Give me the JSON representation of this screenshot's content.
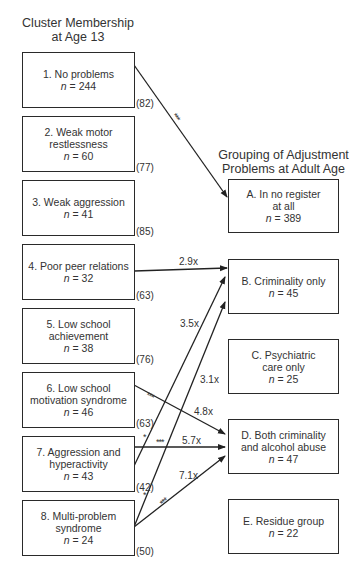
{
  "left_title": [
    "Cluster Membership",
    "at Age 13"
  ],
  "right_title": [
    "Grouping of Adjustment",
    "Problems at Adult Age"
  ],
  "clusters": [
    {
      "id": "1",
      "lines": [
        "1. No problems"
      ],
      "n": "244",
      "pct": "(82)"
    },
    {
      "id": "2",
      "lines": [
        "2. Weak motor",
        "restlessness"
      ],
      "n": "60",
      "pct": "(77)"
    },
    {
      "id": "3",
      "lines": [
        "3. Weak aggression"
      ],
      "n": "41",
      "pct": "(85)"
    },
    {
      "id": "4",
      "lines": [
        "4. Poor peer relations"
      ],
      "n": "32",
      "pct": "(63)"
    },
    {
      "id": "5",
      "lines": [
        "5. Low school",
        "achievement"
      ],
      "n": "38",
      "pct": "(76)"
    },
    {
      "id": "6",
      "lines": [
        "6. Low school",
        "motivation syndrome"
      ],
      "n": "46",
      "pct": "(63)"
    },
    {
      "id": "7",
      "lines": [
        "7. Aggression and",
        "hyperactivity"
      ],
      "n": "43",
      "pct": "(42)"
    },
    {
      "id": "8",
      "lines": [
        "8. Multi-problem",
        "syndrome"
      ],
      "n": "24",
      "pct": "(50)"
    }
  ],
  "outcomes": [
    {
      "id": "A",
      "lines": [
        "A. In no register",
        "at all"
      ],
      "n": "389"
    },
    {
      "id": "B",
      "lines": [
        "B. Criminality only"
      ],
      "n": "45"
    },
    {
      "id": "C",
      "lines": [
        "C. Psychiatric",
        "care only"
      ],
      "n": "25"
    },
    {
      "id": "D",
      "lines": [
        "D. Both criminality",
        "and alcohol abuse"
      ],
      "n": "47"
    },
    {
      "id": "E",
      "lines": [
        "E. Residue group"
      ],
      "n": "22"
    }
  ],
  "links": [
    {
      "from": "1",
      "to": "A",
      "label": "",
      "sig": "***"
    },
    {
      "from": "4",
      "to": "B",
      "label": "2.9x",
      "sig": ""
    },
    {
      "from": "7",
      "to": "B",
      "label": "3.5x",
      "sig": "*"
    },
    {
      "from": "8",
      "to": "B",
      "label": "3.1x",
      "sig": "*"
    },
    {
      "from": "6",
      "to": "D",
      "label": "4.8x",
      "sig": "***"
    },
    {
      "from": "7",
      "to": "D",
      "label": "5.7x",
      "sig": "***"
    },
    {
      "from": "8",
      "to": "D",
      "label": "7.1x",
      "sig": "***"
    }
  ],
  "n_prefix": "n = "
}
